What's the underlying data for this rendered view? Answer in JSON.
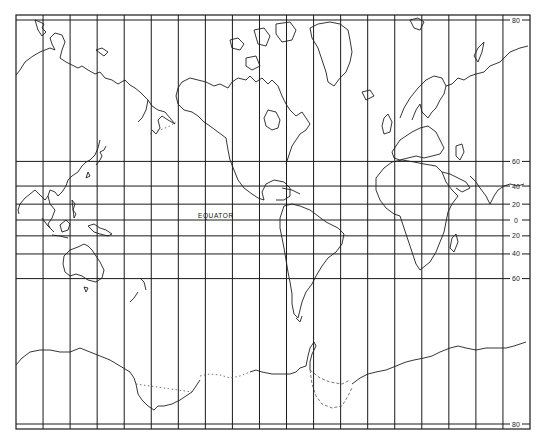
{
  "map": {
    "projection": "Mercator",
    "equator_label": "EQUATOR",
    "latitude_labels": [
      {
        "lat": 80,
        "text": "80"
      },
      {
        "lat": 60,
        "text": "60"
      },
      {
        "lat": 40,
        "text": "40"
      },
      {
        "lat": 20,
        "text": "20"
      },
      {
        "lat": 0,
        "text": "0"
      },
      {
        "lat": -20,
        "text": "20"
      },
      {
        "lat": -40,
        "text": "40"
      },
      {
        "lat": -60,
        "text": "60"
      },
      {
        "lat": -80,
        "text": "80"
      }
    ],
    "meridian_count": 19,
    "colors": {
      "ink": "#1f1f1f",
      "paper": "#ffffff"
    }
  }
}
